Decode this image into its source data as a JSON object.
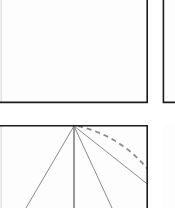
{
  "figure": {
    "canvas_width": 175,
    "canvas_height": 208,
    "background_color": "#ffffff",
    "panel_fill_color": "#fdfdfd",
    "panel_border_color": "#1c1c1c",
    "soft_border_color": "#d9d9d9",
    "line_color": "#8a8a8a",
    "axis_line_color": "#6e6e6e"
  },
  "panels": [
    {
      "id": "panel-top-left",
      "label": "",
      "x": -4,
      "y": -6,
      "width": 152,
      "height": 109,
      "content": "empty",
      "clipped_edges": [
        "left",
        "top"
      ]
    },
    {
      "id": "panel-top-right",
      "label": "",
      "x": 163,
      "y": -6,
      "width": 60,
      "height": 109,
      "content": "empty",
      "clipped_edges": [
        "right",
        "top"
      ]
    },
    {
      "id": "panel-bottom-left",
      "label": "",
      "x": -4,
      "y": 125,
      "width": 152,
      "height": 90,
      "content": "ray-fan-with-arc",
      "clipped_edges": [
        "left",
        "bottom"
      ]
    },
    {
      "id": "panel-bottom-right",
      "label": "",
      "x": 163,
      "y": 125,
      "width": 60,
      "height": 90,
      "content": "empty",
      "clipped_edges": [
        "right",
        "bottom"
      ]
    }
  ],
  "chart_data": {
    "type": "scatter",
    "xlabel": "",
    "ylabel": "",
    "xlim": [
      -4,
      148
    ],
    "ylim": [
      125,
      208
    ],
    "grid": false,
    "legend": "none",
    "apex": {
      "x": 74,
      "y": 126
    },
    "series": [
      {
        "name": "ray-left-outer",
        "style": "solid",
        "color": "#8a8a8a",
        "x": [
          74,
          26
        ],
        "y": [
          126,
          208
        ]
      },
      {
        "name": "ray-vertical-axis",
        "style": "solid",
        "color": "#6e6e6e",
        "x": [
          74,
          74
        ],
        "y": [
          126,
          208
        ]
      },
      {
        "name": "ray-right-inner",
        "style": "solid",
        "color": "#8a8a8a",
        "x": [
          74,
          112
        ],
        "y": [
          126,
          208
        ]
      },
      {
        "name": "ray-right-outer",
        "style": "solid",
        "color": "#8a8a8a",
        "x": [
          74,
          160
        ],
        "y": [
          126,
          194
        ]
      }
    ],
    "annotations": [
      {
        "name": "dashed-arc",
        "style": "dashed",
        "color": "#8a8a8a",
        "dash_pattern": "5 4",
        "start": {
          "x": 78,
          "y": 126
        },
        "control": {
          "x": 141,
          "y": 141
        },
        "end": {
          "x": 169,
          "y": 205
        }
      }
    ]
  }
}
